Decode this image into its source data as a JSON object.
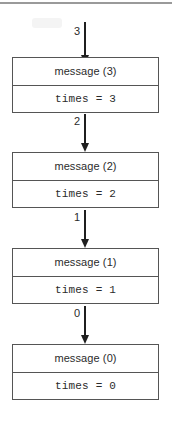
{
  "diagram": {
    "type": "recursion-call-stack-trace",
    "top_rule_color": "#9a9a9a",
    "box_border_color": "#555555",
    "arrow_color": "#1f1f1f",
    "text_color": "#2b2b2b",
    "frames": [
      {
        "title": "message (3)",
        "state": "times = 3"
      },
      {
        "title": "message (2)",
        "state": "times = 2"
      },
      {
        "title": "message (1)",
        "state": "times = 1"
      },
      {
        "title": "message (0)",
        "state": "times = 0"
      }
    ],
    "arrows": [
      {
        "label": "3"
      },
      {
        "label": "2"
      },
      {
        "label": "1"
      },
      {
        "label": "0"
      }
    ]
  }
}
